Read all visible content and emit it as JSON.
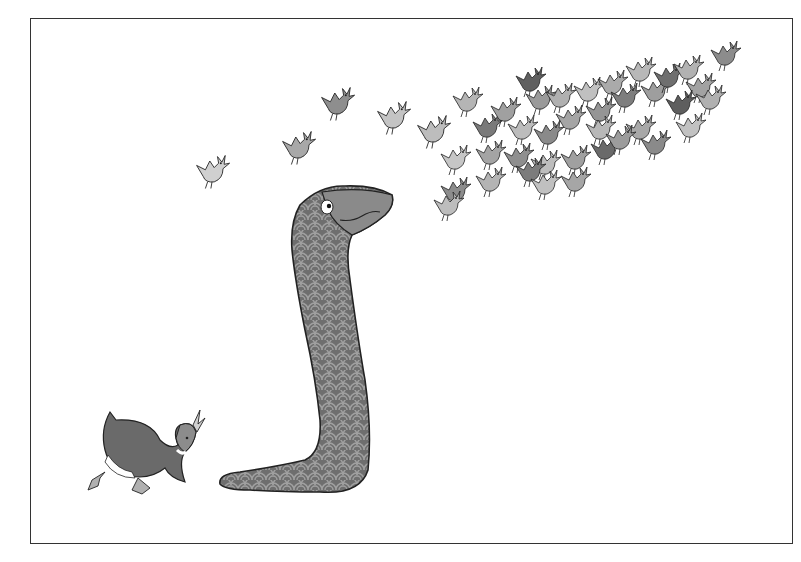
{
  "illustration": {
    "description": "Black-and-white illustration: a long scale-patterned snake looks up at a flock of small birds flying toward the upper right; a duck walks at lower left.",
    "elements": [
      {
        "name": "snake",
        "position": "center",
        "pattern": "scales"
      },
      {
        "name": "duck",
        "position": "lower-left"
      },
      {
        "name": "bird-flock",
        "position": "upper-right",
        "count_approx": 45
      },
      {
        "name": "stray-birds",
        "position": "upper-left-center",
        "count_approx": 5
      }
    ],
    "colors": {
      "background": "#ffffff",
      "frame": "#333333",
      "snake_body": "#6e6e6e",
      "snake_scales": "#9a9a9a",
      "bird_light": "#c8c8c8",
      "bird_mid": "#9a9a9a",
      "bird_dark": "#5a5a5a",
      "outline": "#222222"
    }
  }
}
